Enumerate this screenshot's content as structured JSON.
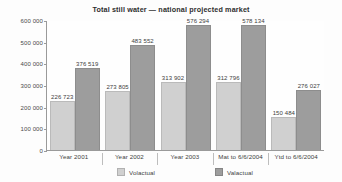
{
  "chart_data": {
    "type": "bar",
    "title": "Total still water — national projected market",
    "xlabel": "",
    "ylabel": "",
    "ylim": [
      0,
      600000
    ],
    "yticks": [
      "0",
      "100 000",
      "200 000",
      "300 000",
      "400 000",
      "500 000",
      "600 000"
    ],
    "ytick_values": [
      0,
      100000,
      200000,
      300000,
      400000,
      500000,
      600000
    ],
    "grid": false,
    "legend_position": "bottom",
    "categories": [
      "Year 2001",
      "Year 2002",
      "Year 2003",
      "Mat to 6/6/2004",
      "Ytd to 6/6/2004"
    ],
    "series": [
      {
        "name": "Volactual",
        "color": "#d0d0d0",
        "values": [
          226723,
          273805,
          313902,
          312796,
          150484
        ],
        "labels": [
          "226 723",
          "273 805",
          "313 902",
          "312 796",
          "150 484"
        ]
      },
      {
        "name": "Valactual",
        "color": "#9d9d9d",
        "values": [
          376519,
          483552,
          576294,
          578134,
          276027
        ],
        "labels": [
          "376 519",
          "483 552",
          "576 294",
          "578 134",
          "276 027"
        ]
      }
    ]
  }
}
